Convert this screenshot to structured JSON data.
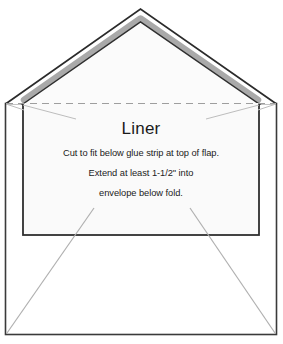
{
  "diagram": {
    "name": "envelope-liner-template",
    "type": "envelope-liner-diagram",
    "background_color": "#ffffff",
    "outline_color": "#2b2b2b",
    "fold_line_color": "#9a9a9a",
    "glue_strip_color": "#a8a8a8",
    "liner_fill_color": "#fafafa",
    "guide_line_color": "#b4b4b4"
  },
  "liner": {
    "title": "Liner",
    "instructions": [
      "Cut to fit below glue strip at top of flap.",
      "Extend at least 1-1/2\" into",
      "envelope below fold."
    ]
  },
  "labels": {
    "flap": "envelope-flap",
    "glue_strip": "glue-strip",
    "fold_line": "fold-line",
    "body": "envelope-body",
    "liner_region": "liner-region"
  }
}
